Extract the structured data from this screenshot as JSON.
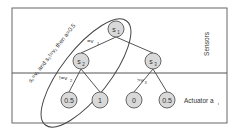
{
  "diagram": {
    "type": "decision-tree",
    "regions": {
      "top_label": "Sensors",
      "bottom_label": "Actuator a",
      "bottom_label_sub": "i"
    },
    "rule_annotation": {
      "text": "s₁=v₁ and s₂!=v₂ then a=0.5"
    },
    "nodes": [
      {
        "id": "s1",
        "label": "s",
        "sub": "1"
      },
      {
        "id": "s2",
        "label": "s",
        "sub": "2"
      },
      {
        "id": "s3",
        "label": "s",
        "sub": "3"
      }
    ],
    "leaves": [
      {
        "id": "leaf1",
        "value": "0.5"
      },
      {
        "id": "leaf2",
        "value": "1"
      },
      {
        "id": "leaf3",
        "value": "0"
      },
      {
        "id": "leaf4",
        "value": "0.5"
      }
    ],
    "edge_labels": {
      "s1_s2": "=v",
      "s1_s2_sub": "1",
      "s2_leaf1": "!=v",
      "s2_leaf1_sub": "2",
      "s3_leaf3": ">v",
      "s3_leaf3_sub": "3"
    },
    "colors": {
      "node_fill": "#d9d9d9",
      "stroke": "#555555",
      "text": "#333333"
    }
  }
}
